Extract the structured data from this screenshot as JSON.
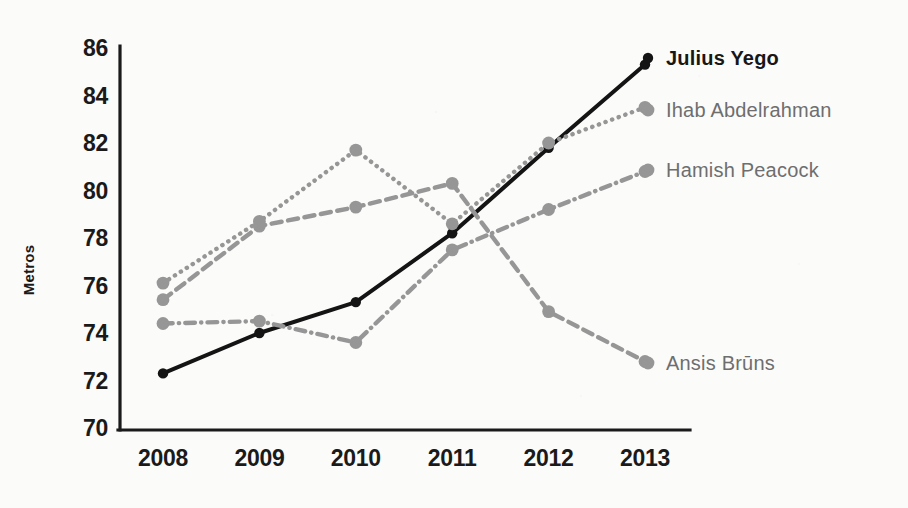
{
  "chart_data": {
    "type": "line",
    "title": "",
    "xlabel": "",
    "ylabel": "Metros",
    "categories": [
      "2008",
      "2009",
      "2010",
      "2011",
      "2012",
      "2013"
    ],
    "x": [
      2008,
      2009,
      2010,
      2011,
      2012,
      2013
    ],
    "ylim": [
      70,
      86
    ],
    "yticks": [
      70,
      72,
      74,
      76,
      78,
      80,
      82,
      84,
      86
    ],
    "ytick_labels": [
      "70",
      "72",
      "74",
      "76",
      "78",
      "80",
      "82",
      "84",
      "86"
    ],
    "grid": false,
    "legend_position": "right-inline-end-of-line",
    "series": [
      {
        "name": "Julius Yego",
        "values": [
          72.3,
          74.0,
          75.3,
          78.2,
          81.8,
          85.3
        ],
        "color": "#141414",
        "style": "solid",
        "emphasis": "primary",
        "label_y": 58
      },
      {
        "name": "Ihab Abdelrahman",
        "values": [
          76.1,
          78.7,
          81.7,
          78.6,
          82.0,
          83.5
        ],
        "color": "#969696",
        "style": "dotted",
        "emphasis": "secondary",
        "label_y": 110
      },
      {
        "name": "Hamish Peacock",
        "values": [
          74.4,
          74.5,
          73.6,
          77.5,
          79.2,
          80.8
        ],
        "color": "#969696",
        "style": "dashdot",
        "emphasis": "secondary",
        "label_y": 170
      },
      {
        "name": "Ansis Brūns",
        "values": [
          75.4,
          78.5,
          79.3,
          80.3,
          74.9,
          72.8
        ],
        "color": "#969696",
        "style": "dashed",
        "emphasis": "secondary",
        "label_y": 363
      }
    ]
  },
  "axes": {
    "y_title": "Metros",
    "y_tick_labels": [
      "86",
      "84",
      "82",
      "80",
      "78",
      "76",
      "74",
      "72",
      "70"
    ],
    "x_tick_labels": [
      "2008",
      "2009",
      "2010",
      "2011",
      "2012",
      "2013"
    ]
  },
  "colors": {
    "ink": "#141414",
    "gray_series": "#969696",
    "label_gray": "#6e6e6e",
    "background": "#fbfbfa"
  }
}
